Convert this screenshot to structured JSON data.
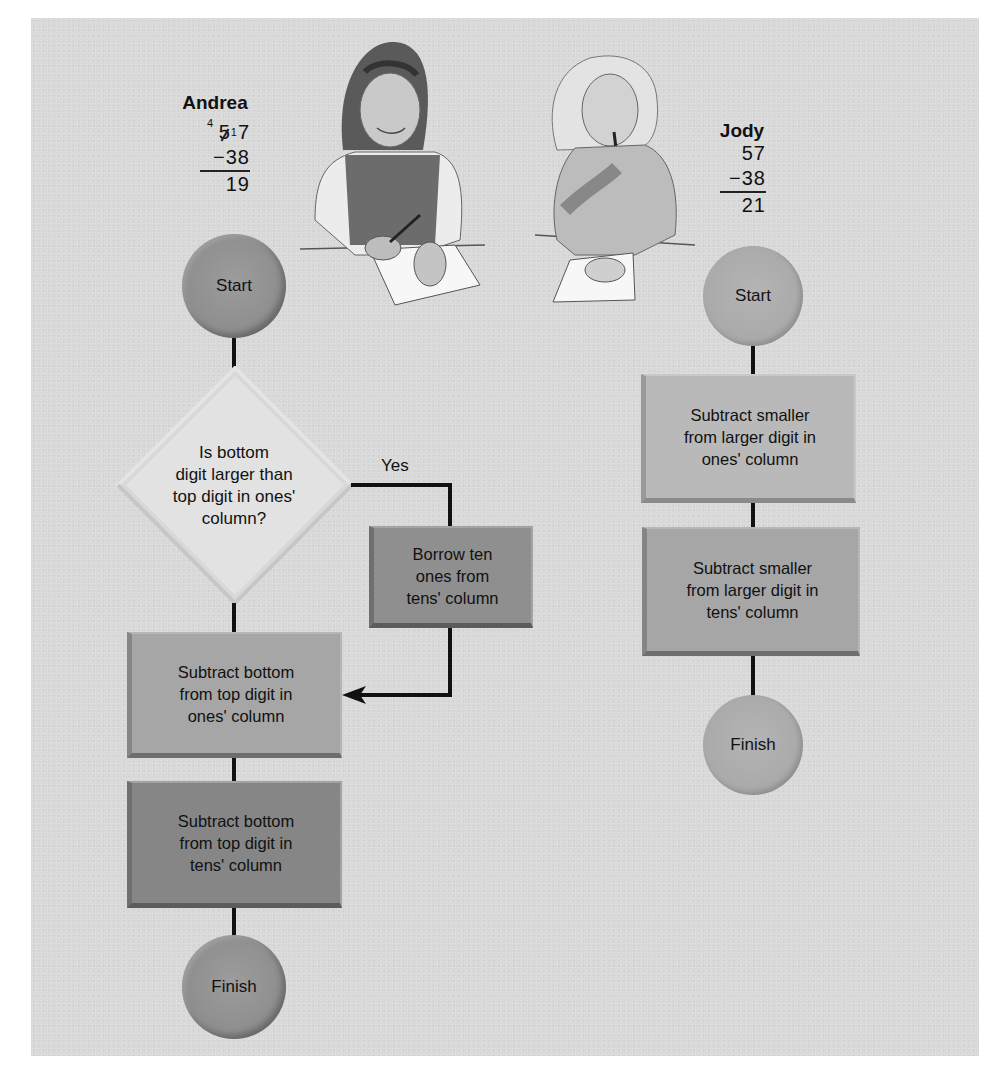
{
  "figure": {
    "background": "#d9d9d9",
    "line_color": "#111111",
    "illustration": {
      "description": "Pencil drawing of two girls seated at a table writing on paper",
      "left_girl": "Andrea",
      "right_girl": "Jody"
    }
  },
  "andrea": {
    "name": "Andrea",
    "problem": {
      "borrow_mark": "4",
      "top": "57",
      "top_tens_crossed": "5",
      "top_ones": "7",
      "ones_mark": "1",
      "bottom": "−38",
      "result": "19"
    },
    "flowchart": {
      "start": "Start",
      "decision": "Is bottom\ndigit larger than\ntop digit in ones'\ncolumn?",
      "yes_label": "Yes",
      "borrow_step": "Borrow ten\nones from\ntens' column",
      "step_ones": "Subtract bottom\nfrom top digit in\nones' column",
      "step_tens": "Subtract bottom\nfrom top digit in\ntens' column",
      "finish": "Finish"
    }
  },
  "jody": {
    "name": "Jody",
    "problem": {
      "top": "57",
      "bottom": "−38",
      "result": "21"
    },
    "flowchart": {
      "start": "Start",
      "step_ones": "Subtract smaller\nfrom larger digit in\nones' column",
      "step_tens": "Subtract smaller\nfrom larger digit in\ntens' column",
      "finish": "Finish"
    }
  }
}
